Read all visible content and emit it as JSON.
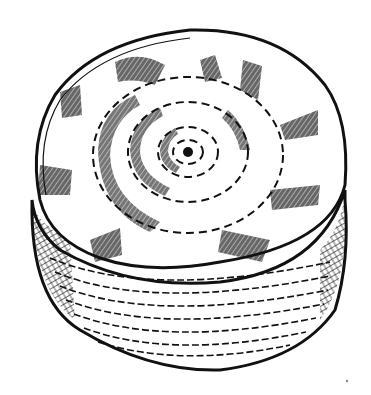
{
  "illustration": {
    "subject": "buffing wheel",
    "style": "black ink line drawing",
    "colors": {
      "ink": "#111111",
      "paper": "#ffffff"
    },
    "wheel": {
      "top_face_center": [
        186,
        152
      ],
      "top_face_rx": 155,
      "top_face_ry": 125,
      "concentric_dashed_rings": 4,
      "crosshatched_patches_on_rim": 9,
      "center_hole": true,
      "side_layers": "stacked dashed cloth layers"
    }
  }
}
